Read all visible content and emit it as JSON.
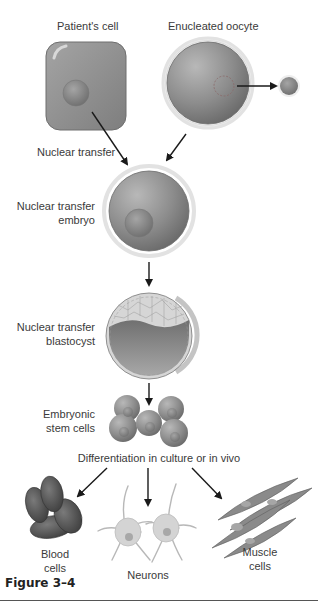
{
  "figure": {
    "caption": "Figure 3–4",
    "labels": {
      "patients_cell": "Patient's cell",
      "enucleated_oocyte": "Enucleated oocyte",
      "nuclear_transfer": "Nuclear transfer",
      "nt_embryo_line1": "Nuclear transfer",
      "nt_embryo_line2": "embryo",
      "nt_blastocyst_line1": "Nuclear transfer",
      "nt_blastocyst_line2": "blastocyst",
      "es_cells_line1": "Embryonic",
      "es_cells_line2": "stem cells",
      "differentiation": "Differentiation in culture or in vivo",
      "blood_line1": "Blood",
      "blood_line2": "cells",
      "neurons": "Neurons",
      "muscle_line1": "Muscle",
      "muscle_line2": "cells"
    },
    "colors": {
      "cell_gray": "#8e8e8e",
      "dark_gray": "#5a5a5a",
      "light_gray": "#c8c8c8",
      "arrow": "#1a1a1a"
    }
  }
}
